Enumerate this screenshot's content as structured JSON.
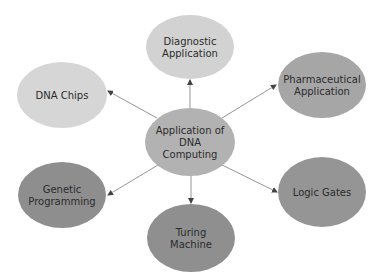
{
  "diagram": {
    "type": "mind-map",
    "center": {
      "id": "center",
      "lines": [
        "Application of",
        "DNA",
        "Computing"
      ],
      "cx": 190,
      "cy": 142,
      "rx": 45,
      "ry": 34,
      "fill": "#b2b2b2"
    },
    "nodes": [
      {
        "id": "diagnostic",
        "lines": [
          "Diagnostic",
          "Application"
        ],
        "cx": 190,
        "cy": 47,
        "rx": 44,
        "ry": 32,
        "fill": "#d2d2d2",
        "edge": {
          "x1": 190,
          "y1": 108,
          "x2": 190,
          "y2": 80
        }
      },
      {
        "id": "dna-chips",
        "lines": [
          "DNA Chips"
        ],
        "cx": 62,
        "cy": 95,
        "rx": 45,
        "ry": 33,
        "fill": "#d6d6d6",
        "edge": {
          "x1": 157,
          "y1": 118,
          "x2": 108,
          "y2": 91
        }
      },
      {
        "id": "pharmaceutical",
        "lines": [
          "Pharmaceutical",
          "Application"
        ],
        "cx": 322,
        "cy": 85,
        "rx": 44,
        "ry": 33,
        "fill": "#a6a6a6",
        "edge": {
          "x1": 222,
          "y1": 118,
          "x2": 276,
          "y2": 85
        }
      },
      {
        "id": "genetic-programming",
        "lines": [
          "Genetic",
          "Programming"
        ],
        "cx": 62,
        "cy": 195,
        "rx": 44,
        "ry": 33,
        "fill": "#8e8e8e",
        "edge": {
          "x1": 158,
          "y1": 165,
          "x2": 108,
          "y2": 195
        }
      },
      {
        "id": "turing-machine",
        "lines": [
          "Turing",
          "Machine"
        ],
        "cx": 191,
        "cy": 238,
        "rx": 44,
        "ry": 34,
        "fill": "#8f8f8f",
        "edge": {
          "x1": 191,
          "y1": 176,
          "x2": 191,
          "y2": 203
        }
      },
      {
        "id": "logic-gates",
        "lines": [
          "Logic Gates"
        ],
        "cx": 322,
        "cy": 192,
        "rx": 44,
        "ry": 35,
        "fill": "#959595",
        "edge": {
          "x1": 222,
          "y1": 165,
          "x2": 277,
          "y2": 192
        }
      }
    ],
    "edge_color": "#7a7a7a"
  }
}
